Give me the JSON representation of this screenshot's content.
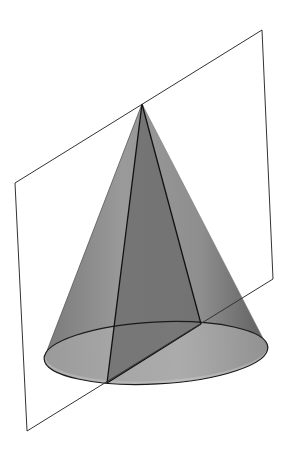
{
  "figure": {
    "colors": {
      "background": "#ffffff",
      "cone_surface": "#8c8c8c",
      "cone_surface_light": "#a6a6a6",
      "cone_surface_dark": "#6a6a6a",
      "section": "#6f6f6f",
      "base_front": "#a9a9a9",
      "stroke": "#1a1a1a",
      "plane_stroke": "#333333"
    },
    "points": {
      "apex": [
        142,
        104
      ],
      "section_front": [
        107,
        383
      ],
      "section_back": [
        201,
        324
      ],
      "silhouette_left": [
        45,
        356
      ],
      "silhouette_right": [
        268,
        348
      ]
    },
    "base_ellipse": {
      "cx": 156,
      "cy": 353,
      "rx": 112,
      "ry": 31,
      "rotate": -3
    },
    "plane": {
      "corners": [
        [
          15,
          183
        ],
        [
          262,
          30
        ],
        [
          273,
          279
        ],
        [
          27,
          431
        ]
      ]
    }
  }
}
